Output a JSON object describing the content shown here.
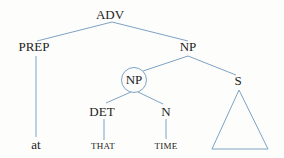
{
  "diagram": {
    "type": "syntax-tree",
    "line_color": "#7ea3c4",
    "nodes": {
      "adv": {
        "label": "ADV"
      },
      "prep": {
        "label": "PREP"
      },
      "np_top": {
        "label": "NP"
      },
      "np_circled": {
        "label": "NP"
      },
      "s": {
        "label": "S"
      },
      "det": {
        "label": "DET"
      },
      "n": {
        "label": "N"
      },
      "at": {
        "label": "at"
      },
      "that": {
        "label": "THAT"
      },
      "time": {
        "label": "TIME"
      }
    },
    "edges": [
      [
        "ADV",
        "PREP"
      ],
      [
        "ADV",
        "NP"
      ],
      [
        "PREP",
        "at"
      ],
      [
        "NP",
        "NP (circled)"
      ],
      [
        "NP",
        "S"
      ],
      [
        "NP (circled)",
        "DET"
      ],
      [
        "NP (circled)",
        "N"
      ],
      [
        "DET",
        "THAT"
      ],
      [
        "N",
        "TIME"
      ],
      [
        "S",
        "triangle"
      ]
    ]
  }
}
